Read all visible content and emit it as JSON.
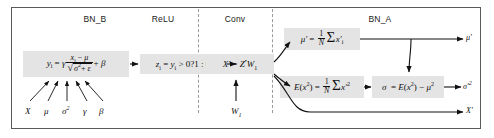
{
  "diagram": {
    "frame_border_color": "#5a5a5a",
    "divider_color": "#9a9a9a",
    "formula_bg_color": "#e4e4e4",
    "text_color": "#111111"
  },
  "columns": [
    {
      "id": "bn_b",
      "label": "BN_B"
    },
    {
      "id": "relu",
      "label": "ReLU"
    },
    {
      "id": "conv",
      "label": "Conv"
    },
    {
      "id": "bn_a",
      "label": "BN_A"
    }
  ],
  "formulas": {
    "bn_b": {
      "lhs": "y",
      "lhs_sub": "i",
      "gamma": "γ",
      "numerator": "x",
      "numerator_sub": "i",
      "minus_mu": "− μ",
      "sqrt_body": "σ",
      "sqrt_exp": "2",
      "sqrt_plus": "+ ε",
      "plus_beta": "+ β",
      "plain_text": "y_i = γ (x_i − μ) / √(σ² + ε) + β"
    },
    "relu": {
      "text": "z",
      "sub": "i",
      "body": "= y",
      "body_sub": "i",
      "condition": "> 0?1 : 0",
      "plain_text": "z_i = y_i > 0?1 : 0"
    },
    "conv": {
      "lhs": "X'",
      "eq": "=",
      "rhs": "Z",
      "op": "*",
      "weight": "W",
      "weight_sub": "1",
      "plain_text": "X' = Z * W₁"
    },
    "mean": {
      "lhs": "μ'",
      "eq": "=",
      "frac_num": "1",
      "frac_den": "N",
      "sum": "Σ",
      "term": "x'",
      "term_sub": "i",
      "plain_text": "μ' = (1/N) Σ x'_i"
    },
    "expectation": {
      "lhs": "E(x",
      "lhs_exp": "2",
      "lhs_close": ")",
      "eq": "=",
      "frac_num": "1",
      "frac_den": "N",
      "sum": "Σ",
      "term": "x'",
      "term_exp": "2",
      "plain_text": "E(x²) = (1/N) Σ x'²"
    },
    "variance": {
      "lhs": "σ",
      "eq": "=",
      "rhs_a": "E(x",
      "rhs_a_exp": "2",
      "rhs_a_close": ")",
      "minus": "−",
      "rhs_b": "μ",
      "rhs_b_exp": "2",
      "plain_text": "σ = E(x²) − μ²"
    }
  },
  "inputs": {
    "bn_b_params": [
      {
        "id": "x",
        "label": "X"
      },
      {
        "id": "mu",
        "label": "μ"
      },
      {
        "id": "sigma2",
        "label": "σ",
        "exp": "2"
      },
      {
        "id": "gamma",
        "label": "γ"
      },
      {
        "id": "beta",
        "label": "β"
      }
    ],
    "conv_weight": {
      "label": "W",
      "sub": "1"
    }
  },
  "outputs": [
    {
      "id": "mu-out",
      "label": "μ'"
    },
    {
      "id": "sigma2-out",
      "label": "σ'",
      "exp": "2"
    },
    {
      "id": "x-out",
      "label": "X'"
    }
  ]
}
